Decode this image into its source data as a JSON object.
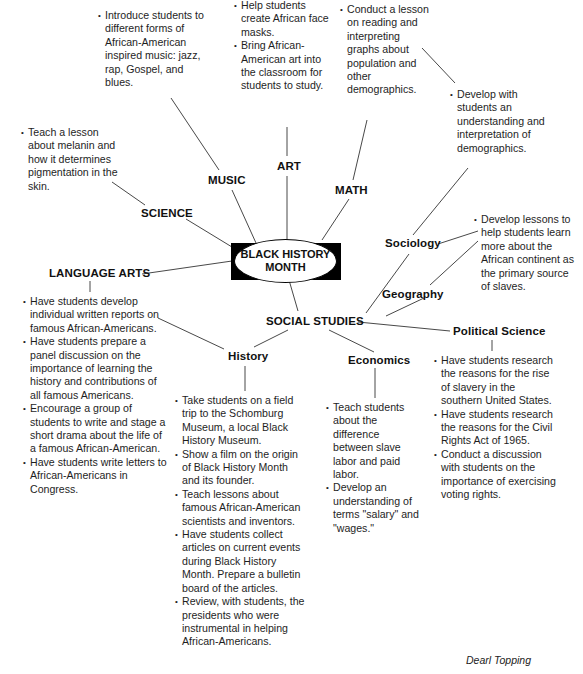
{
  "center": {
    "line1": "BLACK HISTORY",
    "line2": "MONTH"
  },
  "branches": {
    "science": {
      "label": "SCIENCE",
      "items": [
        "Teach a lesson about melanin and how it determines pigmentation in the skin."
      ]
    },
    "music": {
      "label": "MUSIC",
      "items": [
        "Introduce students to different forms of African-American inspired music: jazz, rap, Gospel, and blues."
      ]
    },
    "art": {
      "label": "ART",
      "items": [
        "Help students create African face masks.",
        "Bring African-American art into the classroom for students to study."
      ]
    },
    "math": {
      "label": "MATH",
      "items": [
        "Conduct a lesson on reading and interpreting graphs about population and other demographics."
      ]
    },
    "language_arts": {
      "label": "LANGUAGE ARTS",
      "items": [
        "Have students develop individual written reports on famous African-Americans.",
        "Have students prepare a panel discussion on the importance of learning the history and contributions of all famous Americans.",
        "Encourage a group of students to write and stage a short drama about the life of a famous African-American.",
        "Have students write letters to African-Americans in Congress."
      ]
    },
    "social_studies": {
      "label": "SOCIAL STUDIES",
      "sub": {
        "sociology": {
          "label": "Sociology",
          "items": [
            "Develop with students an understanding and interpretation of demographics."
          ]
        },
        "geography": {
          "label": "Geography",
          "items": [
            "Develop lessons to help students learn more about the African continent as the primary source of slaves."
          ]
        },
        "history": {
          "label": "History",
          "items": [
            "Take students on a field trip to the Schomburg Museum, a local Black History Museum.",
            "Show a film on the origin of Black History Month and its founder.",
            "Teach lessons about famous African-American scientists and inventors.",
            "Have students collect articles on current events during Black History Month. Prepare a bulletin board of the articles.",
            "Review, with students, the presidents who were instrumental in helping African-Americans."
          ]
        },
        "economics": {
          "label": "Economics",
          "items": [
            "Teach students about the difference between slave labor and paid labor.",
            "Develop an understanding of terms \"salary\" and \"wages.\""
          ]
        },
        "political_science": {
          "label": "Political Science",
          "items": [
            "Have students research the reasons for the rise of slavery in the southern United States.",
            "Have students research the reasons for the Civil Rights Act of 1965.",
            "Conduct a discussion with students on the importance of exercising voting rights."
          ]
        }
      }
    }
  },
  "credit": "Dearl Topping"
}
